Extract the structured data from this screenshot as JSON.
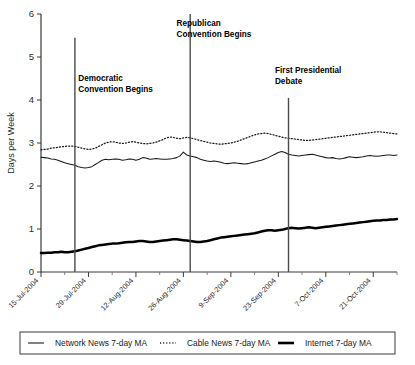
{
  "chart_data": {
    "type": "line",
    "title": "",
    "xlabel": "",
    "ylabel": "Days per Week",
    "ylim": [
      0,
      6
    ],
    "yticks": [
      0,
      1,
      2,
      3,
      4,
      5,
      6
    ],
    "ytick_labels": [
      "0",
      "1",
      "2",
      "3",
      "4",
      "5",
      "6"
    ],
    "grid": false,
    "legend_position": "bottom",
    "x_range": [
      "15-Jul-2004",
      "28-Oct-2004"
    ],
    "xtick_labels": [
      "15-Jul-2004",
      "29-Jul-2004",
      "12-Aug-2004",
      "26-Aug-2004",
      "9-Sep-2004",
      "23-Sep-2004",
      "7-Oct-2004",
      "21-Oct-2004"
    ],
    "xtick_day_offsets": [
      0,
      14,
      28,
      42,
      56,
      70,
      84,
      98
    ],
    "x_day_span": 105,
    "annotations": [
      {
        "label_line1": "Democratic",
        "label_line2": "Convention Begins",
        "day": 10,
        "text_day": 11,
        "text_y": 4.45,
        "line_top_y": 5.45,
        "line_bottom_y": 0.0
      },
      {
        "label_line1": "Republican",
        "label_line2": "Convention Begins",
        "day": 44,
        "text_day": 40,
        "text_y": 5.72,
        "line_top_y": 6.0,
        "line_bottom_y": 0.0
      },
      {
        "label_line1": "First Presidential",
        "label_line2": "Debate",
        "day": 73,
        "text_day": 69,
        "text_y": 4.62,
        "line_top_y": 4.05,
        "line_bottom_y": 0.0
      }
    ],
    "series": [
      {
        "name": "Network News 7-day MA",
        "style": "solid-thin",
        "color": "#1a1a1a",
        "values": [
          2.67,
          2.66,
          2.65,
          2.63,
          2.62,
          2.6,
          2.57,
          2.54,
          2.52,
          2.5,
          2.48,
          2.45,
          2.43,
          2.42,
          2.43,
          2.45,
          2.5,
          2.55,
          2.6,
          2.62,
          2.61,
          2.62,
          2.63,
          2.62,
          2.6,
          2.61,
          2.63,
          2.62,
          2.6,
          2.62,
          2.66,
          2.65,
          2.62,
          2.63,
          2.64,
          2.63,
          2.62,
          2.62,
          2.63,
          2.64,
          2.66,
          2.7,
          2.79,
          2.72,
          2.7,
          2.68,
          2.66,
          2.62,
          2.6,
          2.58,
          2.57,
          2.58,
          2.57,
          2.55,
          2.53,
          2.52,
          2.53,
          2.54,
          2.53,
          2.52,
          2.51,
          2.52,
          2.54,
          2.56,
          2.58,
          2.6,
          2.63,
          2.66,
          2.7,
          2.74,
          2.78,
          2.8,
          2.78,
          2.74,
          2.72,
          2.71,
          2.7,
          2.71,
          2.72,
          2.73,
          2.74,
          2.72,
          2.7,
          2.68,
          2.66,
          2.65,
          2.66,
          2.64,
          2.63,
          2.64,
          2.66,
          2.68,
          2.67,
          2.66,
          2.67,
          2.68,
          2.7,
          2.71,
          2.7,
          2.69,
          2.7,
          2.71,
          2.72,
          2.72,
          2.71,
          2.72
        ]
      },
      {
        "name": "Cable News 7-day MA",
        "style": "dotted",
        "color": "#1a1a1a",
        "values": [
          2.84,
          2.85,
          2.86,
          2.88,
          2.89,
          2.9,
          2.91,
          2.92,
          2.93,
          2.93,
          2.92,
          2.9,
          2.88,
          2.86,
          2.85,
          2.86,
          2.88,
          2.92,
          2.96,
          3.0,
          3.02,
          3.03,
          3.02,
          3.0,
          2.99,
          3.0,
          3.02,
          3.03,
          3.02,
          3.0,
          2.99,
          2.98,
          2.99,
          3.0,
          3.02,
          3.05,
          3.08,
          3.12,
          3.14,
          3.13,
          3.11,
          3.1,
          3.12,
          3.13,
          3.12,
          3.1,
          3.08,
          3.06,
          3.04,
          3.02,
          3.0,
          2.99,
          2.98,
          2.97,
          2.98,
          2.99,
          3.0,
          3.02,
          3.04,
          3.07,
          3.1,
          3.13,
          3.16,
          3.19,
          3.21,
          3.22,
          3.23,
          3.22,
          3.2,
          3.18,
          3.16,
          3.14,
          3.12,
          3.11,
          3.1,
          3.09,
          3.08,
          3.07,
          3.06,
          3.06,
          3.07,
          3.08,
          3.09,
          3.1,
          3.11,
          3.12,
          3.13,
          3.14,
          3.15,
          3.16,
          3.17,
          3.18,
          3.19,
          3.2,
          3.21,
          3.22,
          3.23,
          3.24,
          3.25,
          3.26,
          3.26,
          3.25,
          3.24,
          3.23,
          3.22,
          3.21
        ]
      },
      {
        "name": "Internet 7-day MA",
        "style": "solid-thick",
        "color": "#000000",
        "values": [
          0.44,
          0.44,
          0.45,
          0.45,
          0.46,
          0.46,
          0.47,
          0.46,
          0.46,
          0.47,
          0.48,
          0.5,
          0.52,
          0.54,
          0.56,
          0.58,
          0.6,
          0.62,
          0.63,
          0.64,
          0.65,
          0.66,
          0.66,
          0.67,
          0.68,
          0.69,
          0.7,
          0.7,
          0.71,
          0.72,
          0.72,
          0.71,
          0.7,
          0.7,
          0.71,
          0.72,
          0.73,
          0.74,
          0.75,
          0.76,
          0.76,
          0.75,
          0.74,
          0.73,
          0.72,
          0.71,
          0.7,
          0.7,
          0.71,
          0.72,
          0.74,
          0.76,
          0.78,
          0.8,
          0.81,
          0.82,
          0.83,
          0.84,
          0.85,
          0.86,
          0.87,
          0.88,
          0.89,
          0.9,
          0.92,
          0.94,
          0.96,
          0.97,
          0.97,
          0.96,
          0.97,
          0.98,
          1.0,
          1.02,
          1.03,
          1.02,
          1.01,
          1.02,
          1.03,
          1.04,
          1.03,
          1.02,
          1.03,
          1.04,
          1.05,
          1.06,
          1.07,
          1.08,
          1.09,
          1.1,
          1.11,
          1.12,
          1.13,
          1.14,
          1.15,
          1.16,
          1.17,
          1.18,
          1.19,
          1.2,
          1.2,
          1.21,
          1.21,
          1.22,
          1.22,
          1.23
        ]
      }
    ]
  },
  "legend": {
    "items": [
      {
        "label": "Network News 7-day MA",
        "marker": "solid-thin-line-icon"
      },
      {
        "label": "Cable News 7-day MA",
        "marker": "dotted-line-icon"
      },
      {
        "label": "Internet 7-day MA",
        "marker": "solid-thick-line-icon"
      }
    ]
  }
}
